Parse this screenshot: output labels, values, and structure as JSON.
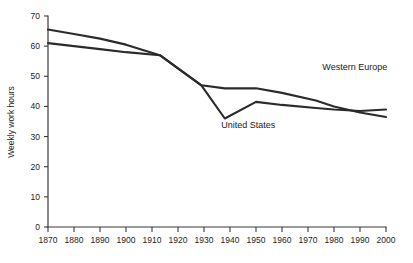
{
  "chart_data": {
    "type": "line",
    "title": "",
    "xlabel": "",
    "ylabel": "Weekly work hours",
    "xlim": [
      1870,
      2000
    ],
    "ylim": [
      0,
      70
    ],
    "grid": false,
    "legend_position": "inline-annotations",
    "x_ticks": [
      "1870",
      "1880",
      "1890",
      "1900",
      "1910",
      "1920",
      "1930",
      "1940",
      "1950",
      "1960",
      "1970",
      "1980",
      "1990",
      "2000"
    ],
    "y_ticks": [
      "0",
      "10",
      "20",
      "30",
      "40",
      "50",
      "60",
      "70"
    ],
    "series": [
      {
        "name": "Western Europe",
        "color": "#2b2b2b",
        "label_x": 1988,
        "label_y": 52,
        "x": [
          1870,
          1880,
          1890,
          1900,
          1913,
          1929,
          1938,
          1950,
          1960,
          1973,
          1980,
          1990,
          2000
        ],
        "values": [
          65.5,
          64,
          62.5,
          60.5,
          57,
          47,
          46,
          46,
          44.5,
          42,
          40,
          38,
          36.5
        ]
      },
      {
        "name": "United States",
        "color": "#2b2b2b",
        "label_x": 1947,
        "label_y": 33,
        "x": [
          1870,
          1880,
          1890,
          1900,
          1913,
          1929,
          1938,
          1950,
          1960,
          1973,
          1980,
          1990,
          2000
        ],
        "values": [
          61,
          60,
          59,
          58,
          57,
          47,
          36,
          41.5,
          40.5,
          39.5,
          39,
          38.5,
          39
        ]
      }
    ]
  },
  "axes": {
    "y_axis_title": "Weekly work hours"
  }
}
